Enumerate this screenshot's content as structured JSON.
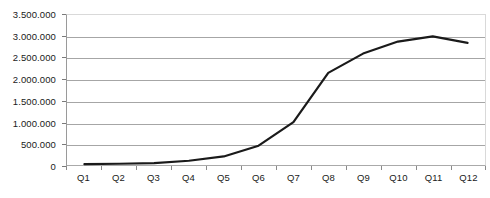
{
  "chart_data": {
    "type": "line",
    "title": "",
    "subtitle": "",
    "xlabel": "",
    "ylabel": "",
    "categories": [
      "Q1",
      "Q2",
      "Q3",
      "Q4",
      "Q5",
      "Q6",
      "Q7",
      "Q8",
      "Q9",
      "Q10",
      "Q11",
      "Q12"
    ],
    "series": [
      {
        "name": "",
        "values": [
          20000,
          30000,
          45000,
          100000,
          200000,
          450000,
          1000000,
          2150000,
          2600000,
          2880000,
          3000000,
          2850000
        ]
      }
    ],
    "ylim": [
      0,
      3500000
    ],
    "ytick_values": [
      0,
      500000,
      1000000,
      1500000,
      2000000,
      2500000,
      3000000,
      3500000
    ],
    "ytick_labels": [
      "0",
      "500.000",
      "1.000.000",
      "1.500.000",
      "2.000.000",
      "2.500.000",
      "3.000.000",
      "3.500.000"
    ],
    "grid": true,
    "grid_axis": "y",
    "legend": false,
    "legend_position": "none",
    "markers": false,
    "line_color": "#1a1a1a",
    "line_width": 2.2,
    "gridline_color": "#a6a6a6",
    "plot_border_color": "#d9d9d9",
    "axis_color": "#9a9a9a",
    "background_color": "#ffffff",
    "text_color": "#1a1a1a"
  }
}
